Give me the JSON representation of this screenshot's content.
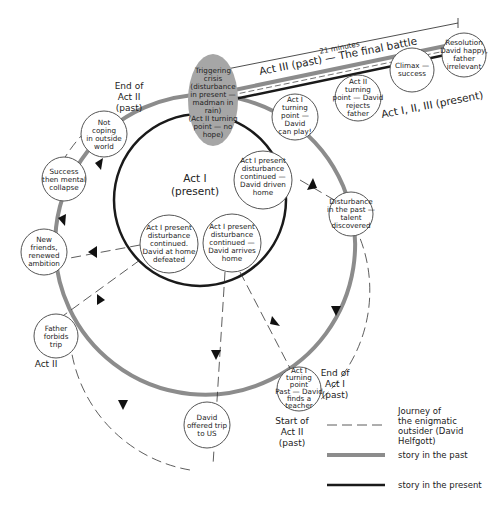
{
  "timeline": {
    "duration_label": "21 minutes",
    "act3_past_label": "Act III (past) — The final battle",
    "act123_present_label": "Act I, II, III (present)"
  },
  "inner_circle": {
    "label_line1": "Act I",
    "label_line2": "(present)"
  },
  "trigger": {
    "lines": [
      "Triggering",
      "crisis",
      "(disturbance",
      "in present —",
      "madman in",
      "rain)",
      "(Act II turning",
      "point — no",
      "hope)"
    ],
    "fill": "#a6a6a6"
  },
  "nodes": [
    {
      "id": "not-coping",
      "lines": [
        "Not",
        "coping",
        "in outside",
        "world"
      ]
    },
    {
      "id": "success-collapse",
      "lines": [
        "Success",
        "then mental",
        "collapse"
      ]
    },
    {
      "id": "new-friends",
      "lines": [
        "New",
        "friends,",
        "renewed",
        "ambition"
      ]
    },
    {
      "id": "father-forbids",
      "lines": [
        "Father",
        "forbids",
        "trip"
      ]
    },
    {
      "id": "offered-trip",
      "lines": [
        "David",
        "offered trip",
        "to US"
      ]
    },
    {
      "id": "finds-teacher",
      "lines": [
        "Act I",
        "turning",
        "point",
        "Past — David",
        "finds a",
        "teacher"
      ]
    },
    {
      "id": "talent-discovered",
      "lines": [
        "Disturbance",
        "in the past —",
        "talent",
        "discovered"
      ]
    },
    {
      "id": "driven-home",
      "lines": [
        "Act I present",
        "disturbance",
        "continued —",
        "David driven",
        "home"
      ]
    },
    {
      "id": "arrives-home",
      "lines": [
        "Act I present",
        "disturbance",
        "continued —",
        "David arrives",
        "home"
      ]
    },
    {
      "id": "home-defeated",
      "lines": [
        "Act I present",
        "disturbance",
        "continued.",
        "David at home",
        "defeated"
      ]
    },
    {
      "id": "can-play",
      "lines": [
        "Act I",
        "turning",
        "point —",
        "David",
        "can play!"
      ]
    },
    {
      "id": "rejects-father",
      "lines": [
        "Act II",
        "turning",
        "point — David",
        "rejects",
        "father"
      ]
    },
    {
      "id": "climax",
      "lines": [
        "Climax —",
        "success"
      ]
    },
    {
      "id": "resolution",
      "lines": [
        "Resolution",
        "David happy,",
        "father",
        "irrelevant"
      ]
    }
  ],
  "labels": {
    "end_act2": [
      "End of",
      "Act II",
      "(past)"
    ],
    "act2": "Act II",
    "end_act1": [
      "End of",
      "Act I",
      "(past)"
    ],
    "start_act2": [
      "Start of",
      "Act II",
      "(past)"
    ]
  },
  "legend": {
    "items": [
      {
        "style": "dashed",
        "lines": [
          "Journey of",
          "the enigmatic",
          "outsider (David",
          "Helfgott)"
        ]
      },
      {
        "style": "past",
        "lines": [
          "story in the past"
        ]
      },
      {
        "style": "present",
        "lines": [
          "story in the present"
        ]
      }
    ]
  },
  "colors": {
    "past_line": "#8c8c8c",
    "present_line": "#1a1a1a",
    "node_stroke": "#555555",
    "text": "#222222"
  }
}
